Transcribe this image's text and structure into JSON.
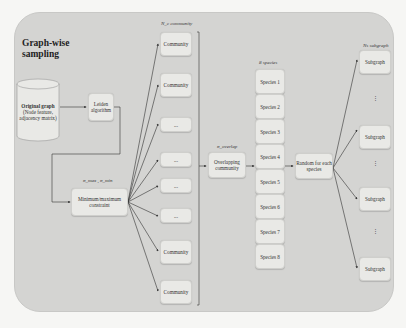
{
  "title": "Graph-wise sampling",
  "title_lines": [
    "Graph-wise",
    "sampling"
  ],
  "original_graph": {
    "label": "Original graph",
    "sub": "(Node feature, adjacency matrix)"
  },
  "leiden": "Leiden algorithm",
  "minmax": {
    "label": "Minimum/maximum constraint",
    "param": "σ_max , σ_min"
  },
  "communities": {
    "header": "N_c community",
    "items": [
      "Community",
      "Community",
      "...",
      "...",
      "...",
      "...",
      "Community",
      "Community"
    ]
  },
  "overlap": {
    "label": "Overlapping community",
    "param": "σ_overlap"
  },
  "species": {
    "header": "8 species",
    "items": [
      "Species 1",
      "Species 2",
      "Species 3",
      "Species 4",
      "Species 5",
      "Species 6",
      "Species 7",
      "Species 8"
    ]
  },
  "random": "Random for each species",
  "subgraphs": {
    "header": "Ns subgraph",
    "items": [
      "Subgraph",
      "Subgraph",
      "Subgraph",
      "Subgraph"
    ],
    "ellipsis": "⋮"
  },
  "colors": {
    "panel": "#d4d4d2",
    "box": "#e9e9e6",
    "line": "#333333"
  }
}
